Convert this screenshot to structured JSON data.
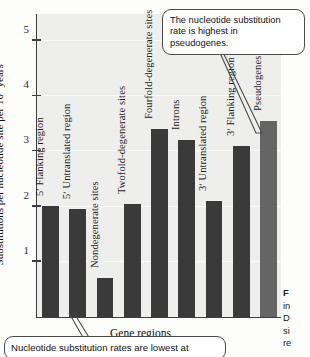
{
  "chart_data": {
    "type": "bar",
    "title": "",
    "xlabel": "Gene regions",
    "ylabel": "Substitutions per nucleotide site per 10⁹ years",
    "ylabel_main": "Substitutions per nucleotide site per 10",
    "ylabel_exponent": "9",
    "ylabel_tail": " years",
    "ylim": [
      0,
      5.5
    ],
    "yticks": [
      1,
      2,
      3,
      4,
      5
    ],
    "ytick_labels": [
      "1",
      "2",
      "3",
      "4",
      "5"
    ],
    "grid": true,
    "legend": "none",
    "categories": [
      "5ʹ Flanking region",
      "5ʹ Untranslated region",
      "Nondegenerate sites",
      "Twofold-degenerate sites",
      "Fourfold-degenerate sites",
      "Introns",
      "3ʹ Untranslated region",
      "3ʹ Flanking region",
      "Pseudogenes"
    ],
    "values": [
      2.0,
      1.95,
      0.7,
      2.05,
      3.4,
      3.2,
      2.1,
      3.1,
      3.55
    ],
    "bar_colors": [
      "#3a3a3a",
      "#3a3a3a",
      "#3a3a3a",
      "#3a3a3a",
      "#3a3a3a",
      "#3a3a3a",
      "#3a3a3a",
      "#3a3a3a",
      "#656565"
    ],
    "plot_background": "#eeeeec",
    "axis_color": "#3d3d3d"
  },
  "annotations": {
    "top_callout": "The nucleotide substitution rate is highest in pseudogenes.",
    "bottom_callout": "Nucleotide substitution rates are lowest at"
  },
  "caption_fragment": {
    "line1": "F",
    "line2": "in",
    "line3": "D",
    "line4": "si",
    "line5": "re"
  }
}
